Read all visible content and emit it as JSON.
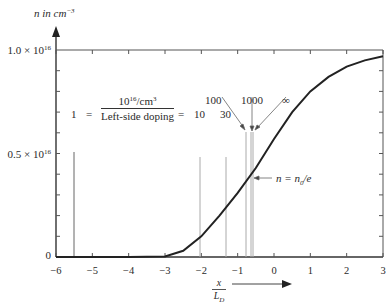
{
  "chart_data": {
    "type": "line",
    "title": "",
    "ylabel": "n in cm^-3",
    "xlabel": "x / L_D",
    "xlim": [
      -6,
      3
    ],
    "ylim": [
      0,
      1e+16
    ],
    "x_ticks": [
      -6,
      -5,
      -4,
      -3,
      -2,
      -1,
      0,
      1,
      2,
      3
    ],
    "y_tick_labels": [
      {
        "value": 0,
        "label": "0"
      },
      {
        "value": 5000000000000000.0,
        "label": "0.5 × 10^16"
      },
      {
        "value": 1e+16,
        "label": "1.0 × 10^16"
      }
    ],
    "grid": false,
    "series": [
      {
        "name": "n(x)",
        "x": [
          -6,
          -5,
          -4,
          -3,
          -2.5,
          -2,
          -1.5,
          -1,
          -0.5,
          0,
          0.5,
          1,
          1.5,
          2,
          2.5,
          3
        ],
        "values": [
          0,
          0,
          5000000000000.0,
          30000000000000.0,
          300000000000000.0,
          1000000000000000.0,
          2000000000000000.0,
          3100000000000000.0,
          4300000000000000.0,
          5700000000000000.0,
          7000000000000000.0,
          8000000000000000.0,
          8700000000000000.0,
          9200000000000000.0,
          9500000000000000.0,
          9700000000000000.0
        ]
      }
    ],
    "vertical_markers": [
      {
        "ratio": "1",
        "x": -5.5
      },
      {
        "ratio": "10",
        "x": -2.03
      },
      {
        "ratio": "30",
        "x": -1.3
      },
      {
        "ratio": "100",
        "x": -0.77
      },
      {
        "ratio": "1000",
        "x": -0.65
      },
      {
        "ratio": "∞",
        "x": -0.6
      }
    ],
    "annotations": [
      "1 = (10^16/cm^3) / (Left-side doping) = 10  30",
      "100",
      "1000",
      "∞",
      "n = n0/e"
    ]
  },
  "labels": {
    "y_axis_title": "n in cm",
    "y_axis_title_exp": "−3",
    "y_top": "1.0 × 10",
    "y_top_exp": "16",
    "y_mid": "0.5 × 10",
    "y_mid_exp": "16",
    "y_zero": "0",
    "x_ticks": [
      "−6",
      "−5",
      "−4",
      "−3",
      "−2",
      "−1",
      "0",
      "1",
      "2",
      "3"
    ],
    "x_axis_num": "x",
    "x_axis_den": "L",
    "x_axis_den_sub": "D",
    "ratio_one": "1",
    "equals1": "=",
    "frac_num": "10",
    "frac_num_exp": "16",
    "frac_num_unit": "/cm",
    "frac_num_unit_exp": "3",
    "frac_den": "Left-side doping",
    "equals2": "=",
    "ratio_10": "10",
    "ratio_30": "30",
    "ratio_100": "100",
    "ratio_1000": "1000",
    "ratio_inf": "∞",
    "annot_n": "n = n",
    "annot_n_sub": "0",
    "annot_n_tail": "/e"
  }
}
